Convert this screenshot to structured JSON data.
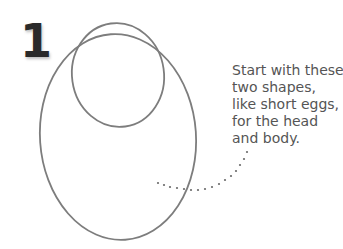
{
  "step": {
    "number": "1"
  },
  "caption": {
    "lines": [
      "Start with these",
      "two shapes,",
      "like short eggs,",
      "for the head",
      "and body."
    ]
  },
  "illustration": {
    "shapes": [
      "head-circle",
      "body-egg"
    ],
    "stroke_color": "#7a7a7a",
    "dot_color": "#666666"
  }
}
